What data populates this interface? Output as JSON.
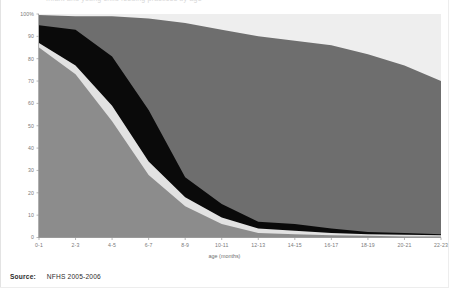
{
  "figure": {
    "title_faint": "Infant and young child feeding practices by age",
    "source_label": "Source:",
    "source_value": "NFHS 2005-2006"
  },
  "chart_data": {
    "type": "area",
    "title": "",
    "xlabel": "age (months)",
    "ylabel": "",
    "ylim": [
      0,
      100
    ],
    "ytick_labels": [
      "0",
      "10",
      "20",
      "30",
      "40",
      "50",
      "60",
      "70",
      "80",
      "90",
      "100%"
    ],
    "ytick_values": [
      0,
      10,
      20,
      30,
      40,
      50,
      60,
      70,
      80,
      90,
      100
    ],
    "grid": false,
    "legend_position": "none",
    "stacked": true,
    "categories": [
      "0-1",
      "2-3",
      "4-5",
      "6-7",
      "8-9",
      "10-11",
      "12-13",
      "14-15",
      "16-17",
      "18-19",
      "20-21",
      "22-23"
    ],
    "series": [
      {
        "name": "Exclusively breastfed",
        "color": "#8c8c8c",
        "values": [
          85,
          73,
          52,
          28,
          14,
          6,
          2,
          1.5,
          1,
          0.8,
          0.5,
          0.4
        ]
      },
      {
        "name": "Breastfed and plain water only",
        "color": "#e2e2e2",
        "values": [
          2,
          4,
          7,
          6,
          4,
          3,
          2,
          1.5,
          1,
          0.7,
          0.7,
          0.6
        ]
      },
      {
        "name": "Breastfed and non-milk liquids",
        "color": "#0a0a0a",
        "values": [
          8,
          16,
          22,
          23,
          9,
          6,
          3,
          3,
          2,
          1,
          0.8,
          0.5
        ]
      },
      {
        "name": "Breastfed and complementary foods",
        "color": "#6e6e6e",
        "values": [
          4.5,
          6,
          18,
          41,
          69,
          78,
          83,
          82,
          82,
          79.5,
          75,
          68.5
        ]
      },
      {
        "name": "Not breastfeeding",
        "color": "#eeeeee",
        "values": [
          0.5,
          1,
          1,
          2,
          4,
          7,
          10,
          12,
          14,
          18,
          23,
          30
        ]
      }
    ],
    "cumulative_top_boundaries": {
      "exclusive": [
        85,
        73,
        52,
        28,
        14,
        6,
        2,
        1.5,
        1,
        0.8,
        0.5,
        0.4
      ],
      "plus_water": [
        87,
        77,
        59,
        34,
        18,
        9,
        4,
        3,
        2,
        1.5,
        1.2,
        1.0
      ],
      "plus_liquids": [
        95,
        93,
        81,
        57,
        27,
        15,
        7,
        6,
        4,
        2.5,
        2.0,
        1.5
      ],
      "plus_complementary": [
        99.5,
        99,
        99,
        98,
        96,
        93,
        90,
        88,
        86,
        82,
        77,
        70
      ]
    }
  }
}
